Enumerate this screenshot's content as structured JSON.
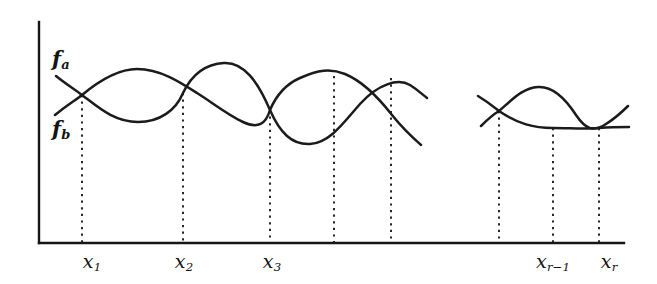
{
  "figure": {
    "background_color": "#ffffff",
    "ink_color": "#161616",
    "width": 657,
    "height": 284,
    "curve_labels": [
      {
        "name": "f-a",
        "text": "f",
        "sub": "a",
        "x": 52,
        "y": 48
      },
      {
        "name": "f-b",
        "text": "f",
        "sub": "b",
        "x": 52,
        "y": 118
      }
    ],
    "axes": {
      "y_axis": {
        "x": 39,
        "y_top": 22,
        "y_bottom": 243
      },
      "x_axis": {
        "y": 243,
        "x_left": 39,
        "x_right": 624
      }
    },
    "tick_labels": [
      {
        "name": "x-1",
        "text": "x",
        "sub": "1",
        "sub_plain": false,
        "x": 92,
        "y": 252
      },
      {
        "name": "x-2",
        "text": "x",
        "sub": "2",
        "sub_plain": false,
        "x": 184,
        "y": 252
      },
      {
        "name": "x-3",
        "text": "x",
        "sub": "3",
        "sub_plain": false,
        "x": 272,
        "y": 252
      },
      {
        "name": "x-r-minus-1",
        "text": "x",
        "sub": "r−1",
        "sub_plain": false,
        "x": 553,
        "y": 252
      },
      {
        "name": "x-r",
        "text": "x",
        "sub": "r",
        "sub_plain": false,
        "x": 609,
        "y": 252
      }
    ],
    "drop_lines": [
      {
        "name": "drop-line-x1",
        "x": 82,
        "y_top": 95,
        "y_bottom": 243
      },
      {
        "name": "drop-line-x2",
        "x": 183,
        "y_top": 93,
        "y_bottom": 243
      },
      {
        "name": "drop-line-x3",
        "x": 270,
        "y_top": 110,
        "y_bottom": 243
      },
      {
        "name": "drop-line-x4",
        "x": 334,
        "y_top": 76,
        "y_bottom": 243
      },
      {
        "name": "drop-line-x5",
        "x": 391,
        "y_top": 78,
        "y_bottom": 243
      },
      {
        "name": "drop-line-x6",
        "x": 499,
        "y_top": 111,
        "y_bottom": 243
      },
      {
        "name": "drop-line-x7",
        "x": 553,
        "y_top": 128,
        "y_bottom": 243
      },
      {
        "name": "drop-line-x8",
        "x": 599,
        "y_top": 128,
        "y_bottom": 243
      }
    ],
    "curves": [
      {
        "name": "curve-fa-left",
        "path": "M 55 115 C 68 104 76 100 82 95 C 100 80 118 69 137 69 C 160 69 180 82 197 93 C 213 103 228 115 243 122 C 258 129 266 124 270 110 C 276 96 286 84 300 78 C 318 70 330 68 345 74 C 362 81 378 97 392 115 C 404 130 412 137 421 145"
      },
      {
        "name": "curve-fb-left",
        "path": "M 56 76 C 66 84 74 89 82 95 C 98 107 114 122 138 122 C 160 122 176 110 183 93 C 192 74 206 64 224 63 C 244 62 258 82 270 110 C 280 133 292 145 310 144 C 330 143 344 122 360 104 C 378 84 398 78 410 85 C 418 90 422 94 427 98"
      },
      {
        "name": "curve-fa-right",
        "path": "M 481 126 C 489 118 494 114 499 111 C 512 100 522 88 538 87 C 553 86 565 98 576 115 C 586 130 594 132 606 124 C 614 119 622 112 628 106"
      },
      {
        "name": "curve-fb-right",
        "path": "M 478 96 C 488 102 494 107 499 111 C 518 124 534 128 553 128 C 570 128 584 129 599 128 C 612 127 622 127 629 127"
      }
    ]
  }
}
